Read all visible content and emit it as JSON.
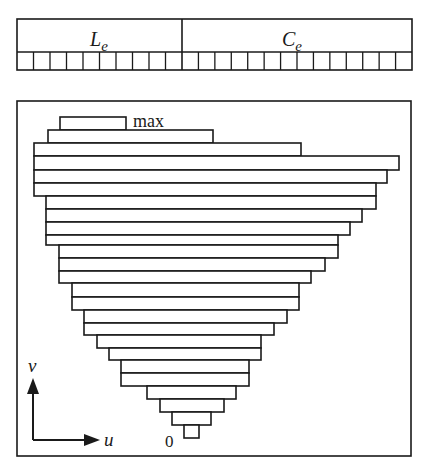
{
  "header_strip": {
    "segments": [
      {
        "label": "L",
        "subscript": "e",
        "cell_count": 10
      },
      {
        "label": "C",
        "subscript": "e",
        "cell_count": 14
      }
    ]
  },
  "diagram": {
    "top_label": "max",
    "bottom_label": "0",
    "axes": {
      "vertical_label": "v",
      "horizontal_label": "u"
    },
    "bars": [
      {
        "y": 117,
        "x1": 60,
        "x2": 126
      },
      {
        "y": 130,
        "x1": 48,
        "x2": 213
      },
      {
        "y": 143,
        "x1": 34,
        "x2": 301
      },
      {
        "y": 156,
        "x1": 34,
        "x2": 399
      },
      {
        "y": 170,
        "x1": 34,
        "x2": 387
      },
      {
        "y": 183,
        "x1": 34,
        "x2": 376
      },
      {
        "y": 196,
        "x1": 46,
        "x2": 376
      },
      {
        "y": 209,
        "x1": 46,
        "x2": 362
      },
      {
        "y": 222,
        "x1": 46,
        "x2": 350
      },
      {
        "y": 235,
        "x1": 46,
        "x2": 338
      },
      {
        "y": 245,
        "x1": 59,
        "x2": 338
      },
      {
        "y": 258,
        "x1": 59,
        "x2": 325
      },
      {
        "y": 271,
        "x1": 59,
        "x2": 311
      },
      {
        "y": 283,
        "x1": 72,
        "x2": 299
      },
      {
        "y": 297,
        "x1": 72,
        "x2": 299
      },
      {
        "y": 310,
        "x1": 84,
        "x2": 287
      },
      {
        "y": 323,
        "x1": 84,
        "x2": 274
      },
      {
        "y": 335,
        "x1": 97,
        "x2": 261
      },
      {
        "y": 348,
        "x1": 109,
        "x2": 261
      },
      {
        "y": 360,
        "x1": 121,
        "x2": 249
      },
      {
        "y": 373,
        "x1": 121,
        "x2": 249
      },
      {
        "y": 386,
        "x1": 147,
        "x2": 236
      },
      {
        "y": 399,
        "x1": 160,
        "x2": 224
      },
      {
        "y": 412,
        "x1": 172,
        "x2": 211
      },
      {
        "y": 425,
        "x1": 184,
        "x2": 199
      }
    ],
    "bar_height": 13
  }
}
